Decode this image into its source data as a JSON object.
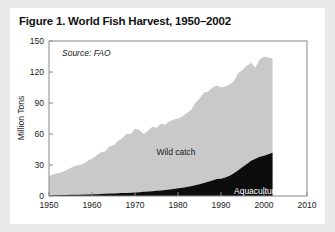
{
  "figure": {
    "title": "Figure 1. World Fish Harvest, 1950–2002",
    "source_note": "Source: FAO"
  },
  "chart_data": {
    "type": "area",
    "title": "Figure 1. World Fish Harvest, 1950–2002",
    "subtitle": "Source: FAO",
    "xlabel": "",
    "ylabel": "Million Tons",
    "xlim": [
      1950,
      2010
    ],
    "ylim": [
      0,
      150
    ],
    "xticks": [
      1950,
      1960,
      1970,
      1980,
      1990,
      2000,
      2010
    ],
    "xtick_labels": [
      "1950",
      "1960",
      "1970",
      "1980",
      "1990",
      "2000",
      "2010"
    ],
    "yticks": [
      0,
      30,
      60,
      90,
      120,
      150
    ],
    "ytick_labels": [
      "0",
      "30",
      "60",
      "90",
      "120",
      "150"
    ],
    "grid": false,
    "stacked": true,
    "legend_position": "inline-annotations",
    "colors": {
      "wild_catch": "#c9c9c9",
      "aquaculture": "#0d0d0d",
      "frame": "#8a8a8a",
      "text": "#1a1a1a",
      "card_background": "#ffffff",
      "page_background": "#e9e9e9"
    },
    "annotations": [
      {
        "text": "Wild catch",
        "x": 1984,
        "y": 62,
        "color": "#1a1a1a"
      },
      {
        "text": "Aquaculture",
        "x": 1995,
        "y": 12,
        "color": "#ffffff"
      },
      {
        "text": "Source: FAO",
        "x": 1953,
        "y": 138,
        "color": "#1a1a1a"
      }
    ],
    "x": [
      1950,
      1951,
      1952,
      1953,
      1954,
      1955,
      1956,
      1957,
      1958,
      1959,
      1960,
      1961,
      1962,
      1963,
      1964,
      1965,
      1966,
      1967,
      1968,
      1969,
      1970,
      1971,
      1972,
      1973,
      1974,
      1975,
      1976,
      1977,
      1978,
      1979,
      1980,
      1981,
      1982,
      1983,
      1984,
      1985,
      1986,
      1987,
      1988,
      1989,
      1990,
      1991,
      1992,
      1993,
      1994,
      1995,
      1996,
      1997,
      1998,
      1999,
      2000,
      2001,
      2002
    ],
    "series": [
      {
        "name": "Aquaculture",
        "color": "#0d0d0d",
        "values": [
          0.6,
          0.7,
          0.8,
          0.9,
          1.0,
          1.1,
          1.2,
          1.3,
          1.4,
          1.5,
          1.7,
          1.8,
          2.0,
          2.1,
          2.3,
          2.4,
          2.6,
          2.8,
          3.0,
          3.2,
          3.5,
          3.7,
          4.0,
          4.3,
          4.6,
          5.0,
          5.4,
          5.8,
          6.3,
          6.8,
          7.4,
          8.0,
          8.7,
          9.5,
          10.4,
          11.4,
          12.5,
          13.7,
          15.0,
          16.4,
          16.8,
          18.0,
          19.5,
          22.0,
          25.0,
          28.0,
          31.0,
          34.0,
          36.0,
          38.0,
          39.0,
          40.5,
          41.9
        ]
      },
      {
        "name": "Wild catch",
        "color": "#c9c9c9",
        "values": [
          18.4,
          20.3,
          21.2,
          22.1,
          24.0,
          25.9,
          27.8,
          28.7,
          29.6,
          32.5,
          34.3,
          37.2,
          40.0,
          40.9,
          45.7,
          46.6,
          50.4,
          53.2,
          57.0,
          56.8,
          61.5,
          60.3,
          56.0,
          58.7,
          62.4,
          61.0,
          64.6,
          63.2,
          65.7,
          67.2,
          67.6,
          69.0,
          71.3,
          73.5,
          79.6,
          82.6,
          87.5,
          87.3,
          90.0,
          90.6,
          88.2,
          88.0,
          88.5,
          89.0,
          94.0,
          94.0,
          95.0,
          95.0,
          88.0,
          94.0,
          96.0,
          93.5,
          91.1
        ]
      }
    ],
    "totals": [
      19.0,
      21.0,
      22.0,
      23.0,
      25.0,
      27.0,
      29.0,
      30.0,
      31.0,
      34.0,
      36.0,
      39.0,
      42.0,
      43.0,
      48.0,
      49.0,
      53.0,
      56.0,
      60.0,
      60.0,
      65.0,
      64.0,
      60.0,
      63.0,
      67.0,
      66.0,
      70.0,
      69.0,
      72.0,
      74.0,
      75.0,
      77.0,
      80.0,
      83.0,
      90.0,
      94.0,
      100.0,
      101.0,
      105.0,
      107.0,
      105.0,
      106.0,
      108.0,
      111.0,
      119.0,
      122.0,
      126.0,
      129.0,
      124.0,
      132.0,
      135.0,
      134.0,
      133.0
    ]
  }
}
